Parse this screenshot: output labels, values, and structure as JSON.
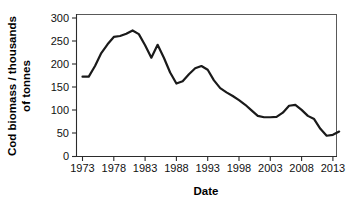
{
  "figure": {
    "background_color": "#ffffff",
    "line_color": "#1a1a1a",
    "axis_color": "#2b2b2b",
    "frame_color": "#595959"
  },
  "axes": {
    "y_title_line1": "Cod biomass / thousands",
    "y_title_line2": "of tonnes",
    "x_title": "Date",
    "y_ticks": [
      "0",
      "50",
      "100",
      "150",
      "200",
      "250",
      "300"
    ],
    "x_ticks": [
      "1973",
      "1978",
      "1983",
      "1988",
      "1993",
      "1998",
      "2003",
      "2008",
      "2013"
    ]
  },
  "chart_data": {
    "type": "line",
    "title": "",
    "xlabel": "Date",
    "ylabel": "Cod biomass / thousands of tonnes",
    "xlim": [
      1972,
      2015
    ],
    "ylim": [
      0,
      310
    ],
    "ytick_values": [
      0,
      50,
      100,
      150,
      200,
      250,
      300
    ],
    "xtick_values": [
      1973,
      1978,
      1983,
      1988,
      1993,
      1998,
      2003,
      2008,
      2013
    ],
    "grid": false,
    "legend": "none",
    "series": [
      {
        "name": "Cod biomass",
        "x": [
          1973,
          1974,
          1975,
          1976,
          1977,
          1978,
          1979,
          1980,
          1981,
          1982,
          1983,
          1984,
          1985,
          1986,
          1987,
          1988,
          1989,
          1990,
          1991,
          1992,
          1993,
          1994,
          1995,
          1996,
          1997,
          1998,
          1999,
          2000,
          2001,
          2002,
          2003,
          2004,
          2005,
          2006,
          2007,
          2008,
          2009,
          2010,
          2011,
          2012,
          2013,
          2014
        ],
        "y": [
          173,
          173,
          196,
          224,
          243,
          259,
          261,
          266,
          273,
          265,
          241,
          214,
          242,
          214,
          182,
          158,
          163,
          178,
          191,
          196,
          188,
          165,
          148,
          139,
          131,
          122,
          112,
          100,
          88,
          85,
          85,
          86,
          95,
          110,
          112,
          101,
          88,
          81,
          60,
          45,
          47,
          54
        ]
      }
    ]
  }
}
